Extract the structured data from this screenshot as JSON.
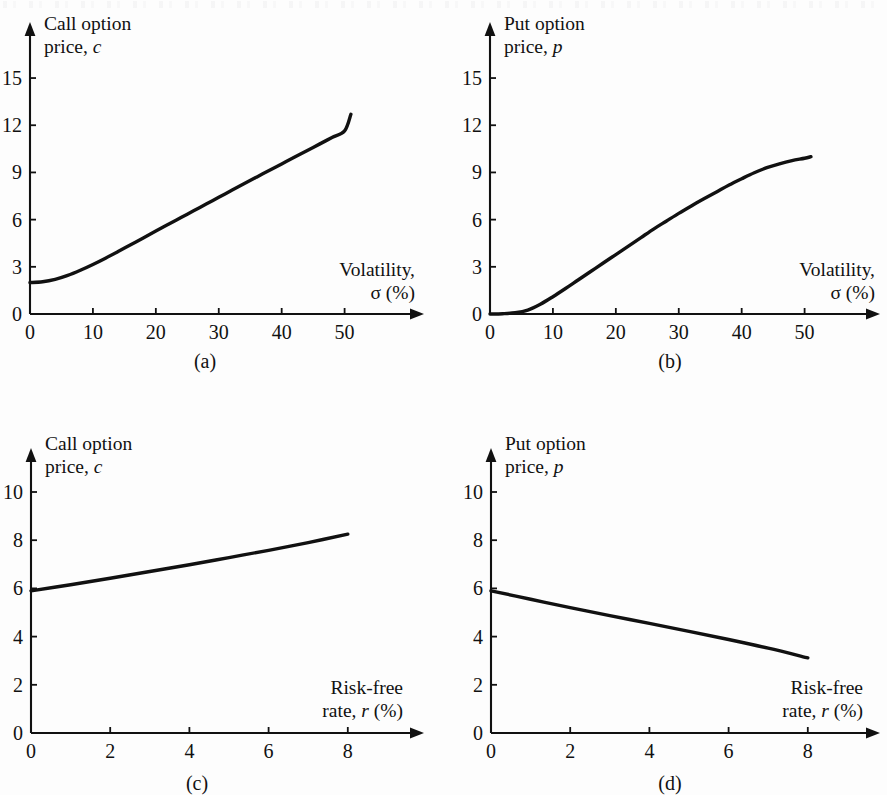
{
  "figure": {
    "background_color": "#fdfdfd",
    "ink_color": "#111111",
    "panel_captions": {
      "a": "(a)",
      "b": "(b)",
      "c": "(c)",
      "d": "(d)"
    }
  },
  "labels": {
    "call_option": "Call option",
    "put_option": "Put option",
    "price_c_prefix": "price, ",
    "price_c_var": "c",
    "price_p_prefix": "price, ",
    "price_p_var": "p",
    "volatility": "Volatility,",
    "sigma_percent": "σ (%)",
    "risk_free": "Risk-free",
    "rate_prefix": "rate, ",
    "rate_var": "r",
    "rate_suffix": " (%)"
  },
  "panel_a": {
    "y_ticks": [
      "0",
      "3",
      "6",
      "9",
      "12",
      "15"
    ],
    "x_ticks": [
      "0",
      "10",
      "20",
      "30",
      "40",
      "50"
    ],
    "y_title_line1": "Call option",
    "y_title_line2_prefix": "price, ",
    "y_title_line2_var": "c",
    "x_title_line1": "Volatility,",
    "x_title_line2": "σ (%)",
    "caption": "(a)"
  },
  "panel_b": {
    "y_ticks": [
      "0",
      "3",
      "6",
      "9",
      "12",
      "15"
    ],
    "x_ticks": [
      "0",
      "10",
      "20",
      "30",
      "40",
      "50"
    ],
    "y_title_line1": "Put option",
    "y_title_line2_prefix": "price, ",
    "y_title_line2_var": "p",
    "x_title_line1": "Volatility,",
    "x_title_line2": "σ (%)",
    "caption": "(b)"
  },
  "panel_c": {
    "y_ticks": [
      "0",
      "2",
      "4",
      "6",
      "8",
      "10"
    ],
    "x_ticks": [
      "0",
      "2",
      "4",
      "6",
      "8"
    ],
    "y_title_line1": "Call option",
    "y_title_line2_prefix": "price, ",
    "y_title_line2_var": "c",
    "x_title_line1": "Risk-free",
    "x_title_line2_prefix": "rate, ",
    "x_title_line2_var": "r",
    "x_title_line2_suffix": " (%)",
    "caption": "(c)"
  },
  "panel_d": {
    "y_ticks": [
      "0",
      "2",
      "4",
      "6",
      "8",
      "10"
    ],
    "x_ticks": [
      "0",
      "2",
      "4",
      "6",
      "8"
    ],
    "y_title_line1": "Put option",
    "y_title_line2_prefix": "price, ",
    "y_title_line2_var": "p",
    "x_title_line1": "Risk-free",
    "x_title_line2_prefix": "rate, ",
    "x_title_line2_var": "r",
    "x_title_line2_suffix": " (%)",
    "caption": "(d)"
  },
  "chart_data": [
    {
      "id": "a",
      "type": "line",
      "title": "(a) Call option price vs volatility",
      "xlabel": "Volatility, σ (%)",
      "ylabel": "Call option price, c",
      "xlim": [
        0,
        57
      ],
      "ylim": [
        0,
        17
      ],
      "xticks": [
        0,
        10,
        20,
        30,
        40,
        50
      ],
      "yticks": [
        0,
        3,
        6,
        9,
        12,
        15
      ],
      "grid": false,
      "legend": "none",
      "series": [
        {
          "name": "Call option price, c",
          "x": [
            0,
            2,
            4,
            6,
            8,
            10,
            12,
            14,
            16,
            18,
            20,
            22,
            24,
            26,
            28,
            30,
            32,
            34,
            36,
            38,
            40,
            42,
            44,
            46,
            48,
            50,
            51
          ],
          "y": [
            2.0,
            2.05,
            2.2,
            2.45,
            2.78,
            3.15,
            3.55,
            3.97,
            4.4,
            4.83,
            5.27,
            5.7,
            6.13,
            6.56,
            6.99,
            7.42,
            7.85,
            8.28,
            8.7,
            9.12,
            9.54,
            9.96,
            10.38,
            10.8,
            11.22,
            11.64,
            12.7
          ]
        }
      ]
    },
    {
      "id": "b",
      "type": "line",
      "title": "(b) Put option price vs volatility",
      "xlabel": "Volatility, σ (%)",
      "ylabel": "Put option price, p",
      "xlim": [
        0,
        57
      ],
      "ylim": [
        0,
        17
      ],
      "xticks": [
        0,
        10,
        20,
        30,
        40,
        50
      ],
      "yticks": [
        0,
        3,
        6,
        9,
        12,
        15
      ],
      "grid": false,
      "legend": "none",
      "series": [
        {
          "name": "Put option price, p",
          "x": [
            0,
            2,
            4,
            6,
            8,
            10,
            12,
            14,
            16,
            18,
            20,
            22,
            24,
            26,
            28,
            30,
            32,
            34,
            36,
            38,
            40,
            42,
            44,
            46,
            48,
            50,
            51
          ],
          "y": [
            0.0,
            0.02,
            0.08,
            0.25,
            0.62,
            1.1,
            1.62,
            2.16,
            2.7,
            3.24,
            3.78,
            4.32,
            4.86,
            5.4,
            5.9,
            6.4,
            6.87,
            7.32,
            7.76,
            8.2,
            8.6,
            8.98,
            9.3,
            9.55,
            9.75,
            9.9,
            10.0
          ]
        }
      ]
    },
    {
      "id": "c",
      "type": "line",
      "title": "(c) Call option price vs risk-free rate",
      "xlabel": "Risk-free rate, r (%)",
      "ylabel": "Call option price, c",
      "xlim": [
        0,
        9.2
      ],
      "ylim": [
        0,
        11.5
      ],
      "xticks": [
        0,
        2,
        4,
        6,
        8
      ],
      "yticks": [
        0,
        2,
        4,
        6,
        8,
        10
      ],
      "grid": false,
      "legend": "none",
      "series": [
        {
          "name": "Call option price, c",
          "x": [
            0,
            1,
            2,
            3,
            4,
            5,
            6,
            7,
            8
          ],
          "y": [
            5.9,
            6.15,
            6.42,
            6.7,
            6.98,
            7.28,
            7.58,
            7.9,
            8.25
          ]
        }
      ]
    },
    {
      "id": "d",
      "type": "line",
      "title": "(d) Put option price vs risk-free rate",
      "xlabel": "Risk-free rate, r (%)",
      "ylabel": "Put option price, p",
      "xlim": [
        0,
        9.2
      ],
      "ylim": [
        0,
        11.5
      ],
      "xticks": [
        0,
        2,
        4,
        6,
        8
      ],
      "yticks": [
        0,
        2,
        4,
        6,
        8,
        10
      ],
      "grid": false,
      "legend": "none",
      "series": [
        {
          "name": "Put option price, p",
          "x": [
            0,
            1,
            2,
            3,
            4,
            5,
            6,
            7,
            8
          ],
          "y": [
            5.9,
            5.55,
            5.2,
            4.87,
            4.55,
            4.22,
            3.88,
            3.52,
            3.12
          ]
        }
      ]
    }
  ]
}
